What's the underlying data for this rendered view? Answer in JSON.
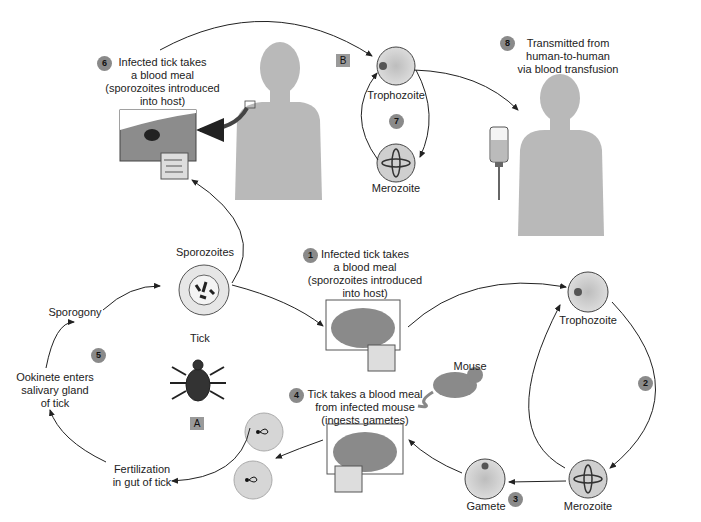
{
  "panels": {
    "A": "A",
    "B": "B"
  },
  "steps": [
    {
      "num": "1",
      "text": [
        "Infected tick takes",
        "a blood meal",
        "(sporozoites introduced",
        "into host)"
      ]
    },
    {
      "num": "2",
      "text": []
    },
    {
      "num": "3",
      "text": []
    },
    {
      "num": "4",
      "text": [
        "Tick takes a blood meal",
        "from infected mouse",
        "(ingests gametes)"
      ]
    },
    {
      "num": "5",
      "text": []
    },
    {
      "num": "6",
      "text": [
        "Infected tick takes",
        "a blood meal",
        "(sporozoites introduced",
        "into host)"
      ]
    },
    {
      "num": "7",
      "text": []
    },
    {
      "num": "8",
      "text": [
        "Transmitted from",
        "human-to-human",
        "via blood transfusion"
      ]
    }
  ],
  "stages": {
    "trophozoite_human": "Trophozoite",
    "merozoite_human": "Merozoite",
    "trophozoite_mouse": "Trophozoite",
    "merozoite_mouse": "Merozoite",
    "gamete": "Gamete",
    "sporozoites": "Sporozoites",
    "sporogony": "Sporogony",
    "ookinete": [
      "Ookinete enters",
      "salivary gland",
      "of tick"
    ],
    "fertilization": [
      "Fertilization",
      "in gut of tick"
    ],
    "tick": "Tick",
    "mouse": "Mouse"
  },
  "colors": {
    "silhouette": "#b9b9b9",
    "step_badge": "#8a8a8a",
    "cell_fill": "#d0d0d0",
    "arrow": "#222222"
  }
}
